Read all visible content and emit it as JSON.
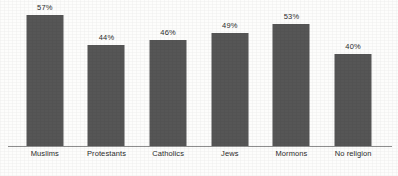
{
  "chart_data": {
    "type": "bar",
    "title": "",
    "subtitle": "",
    "xlabel": "",
    "ylabel": "",
    "categories": [
      "Muslims",
      "Protestants",
      "Catholics",
      "Jews",
      "Mormons",
      "No religion"
    ],
    "values": [
      57,
      44,
      46,
      49,
      53,
      40
    ],
    "value_labels": [
      "57%",
      "44%",
      "46%",
      "49%",
      "53%",
      "40%"
    ],
    "ylim": [
      0,
      60
    ],
    "grid": false,
    "legend": null,
    "axis": {
      "baseline_visible": true,
      "y_axis_visible": false,
      "y_ticks": [],
      "x_tick_labels_position": "below-baseline"
    },
    "style": {
      "bar_color": "#565656",
      "baseline_color": "#8e8e8e",
      "label_color": "#2b2b2b",
      "background_color": "#fdfdfc"
    }
  }
}
